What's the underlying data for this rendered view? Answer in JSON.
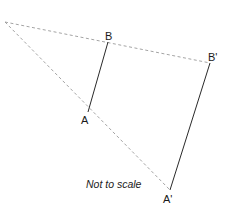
{
  "diagram": {
    "type": "enlargement",
    "points": {
      "B": {
        "label": "B"
      },
      "B_prime": {
        "label": "B'"
      },
      "A": {
        "label": "A"
      },
      "A_prime": {
        "label": "A'"
      }
    },
    "segments": [
      {
        "from": "B",
        "to": "A",
        "style": "solid"
      },
      {
        "from": "B_prime",
        "to": "A_prime",
        "style": "solid"
      },
      {
        "from": "centre",
        "to": "B_prime",
        "style": "dashed",
        "through": "B"
      },
      {
        "from": "centre",
        "to": "A_prime",
        "style": "dashed",
        "through": "A"
      }
    ],
    "note": "Not to scale",
    "colors": {
      "solid_line": "#2a2a2a",
      "dashed_line": "#9a9a9a",
      "text": "#1a1a1a",
      "background": "#ffffff"
    }
  }
}
